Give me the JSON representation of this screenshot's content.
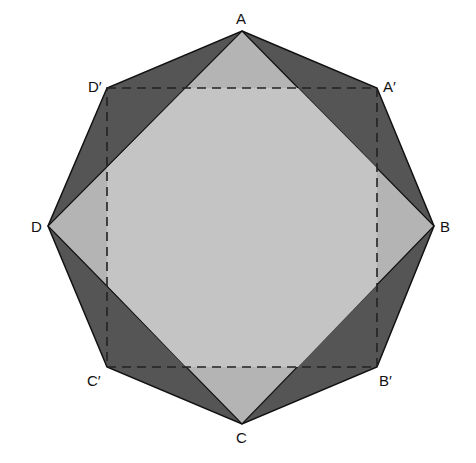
{
  "figure": {
    "colors": {
      "background": "#ffffff",
      "octagon_fill": "#555555",
      "square_abcd_fill": "#b4b4b4",
      "overlap_fill": "#c6c6c6",
      "stroke": "#111111",
      "dashed_stroke": "#222222"
    },
    "vertices": {
      "A": {
        "label": "A",
        "x": 242,
        "y": 31
      },
      "A_prime": {
        "label": "A′",
        "x": 377,
        "y": 88
      },
      "B": {
        "label": "B",
        "x": 434,
        "y": 226
      },
      "B_prime": {
        "label": "B′",
        "x": 377,
        "y": 367
      },
      "C": {
        "label": "C",
        "x": 242,
        "y": 424
      },
      "C_prime": {
        "label": "C′",
        "x": 107,
        "y": 367
      },
      "D": {
        "label": "D",
        "x": 48,
        "y": 226
      },
      "D_prime": {
        "label": "D′",
        "x": 107,
        "y": 88
      }
    },
    "labels": {
      "A": "A",
      "A_prime": "A′",
      "B": "B",
      "B_prime": "B′",
      "C": "C",
      "C_prime": "C′",
      "D": "D",
      "D_prime": "D′"
    }
  }
}
